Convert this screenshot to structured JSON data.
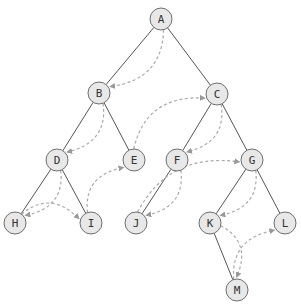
{
  "diagram": {
    "type": "binary-tree-traversal",
    "colors": {
      "node_fill": "#e8e8e8",
      "node_stroke": "#6e6e6e",
      "edge": "#555555",
      "traversal_arrow": "#aaaaaa",
      "label": "#333333"
    },
    "nodes": [
      {
        "id": "A",
        "label": "A",
        "x": 161,
        "y": 19
      },
      {
        "id": "B",
        "label": "B",
        "x": 99,
        "y": 93
      },
      {
        "id": "C",
        "label": "C",
        "x": 217,
        "y": 94
      },
      {
        "id": "D",
        "label": "D",
        "x": 57,
        "y": 160
      },
      {
        "id": "E",
        "label": "E",
        "x": 134,
        "y": 160
      },
      {
        "id": "F",
        "label": "F",
        "x": 177,
        "y": 160
      },
      {
        "id": "G",
        "label": "G",
        "x": 252,
        "y": 160
      },
      {
        "id": "H",
        "label": "H",
        "x": 15,
        "y": 223
      },
      {
        "id": "I",
        "label": "I",
        "x": 91,
        "y": 223
      },
      {
        "id": "J",
        "label": "J",
        "x": 136,
        "y": 223
      },
      {
        "id": "K",
        "label": "K",
        "x": 210,
        "y": 223
      },
      {
        "id": "L",
        "label": "L",
        "x": 285,
        "y": 223
      },
      {
        "id": "M",
        "label": "M",
        "x": 237,
        "y": 290
      }
    ],
    "edges": [
      [
        "A",
        "B"
      ],
      [
        "A",
        "C"
      ],
      [
        "B",
        "D"
      ],
      [
        "B",
        "E"
      ],
      [
        "C",
        "F"
      ],
      [
        "C",
        "G"
      ],
      [
        "D",
        "H"
      ],
      [
        "D",
        "I"
      ],
      [
        "F",
        "J"
      ],
      [
        "G",
        "K"
      ],
      [
        "G",
        "L"
      ],
      [
        "K",
        "M"
      ]
    ],
    "traversal_order": [
      "A",
      "B",
      "D",
      "H",
      "I",
      "E",
      "C",
      "F",
      "J",
      "G",
      "K",
      "M",
      "L"
    ]
  }
}
